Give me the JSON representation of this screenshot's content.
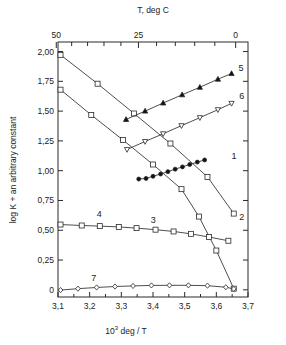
{
  "figure": {
    "top_axis_title": "T, deg C",
    "bottom_axis_title_prefix": "10",
    "bottom_axis_title_sup": "3",
    "bottom_axis_title_suffix": " deg / T",
    "y_axis_title": "log K + an arbitrary constant"
  },
  "chart_data": {
    "type": "line",
    "title": "",
    "xlabel": "10^3 deg / T",
    "ylabel": "log K + an arbitrary constant",
    "xlim": [
      3.1,
      3.7
    ],
    "ylim": [
      -0.06,
      2.08
    ],
    "grid": false,
    "legend": "inline-curve-labels",
    "x_ticks": [
      3.1,
      3.2,
      3.3,
      3.4,
      3.5,
      3.6,
      3.7
    ],
    "x_tick_labels": [
      "3,1",
      "3,2",
      "3,3",
      "3,4",
      "3,5",
      "3,6",
      "3,7"
    ],
    "x_minor_ticks": [
      3.15,
      3.25,
      3.35,
      3.45,
      3.55,
      3.65
    ],
    "y_ticks": [
      0,
      0.25,
      0.5,
      0.75,
      1.0,
      1.25,
      1.5,
      1.75,
      2.0
    ],
    "y_tick_labels": [
      "0",
      "0,25",
      "0,50",
      "0,75",
      "1,00",
      "1,25",
      "1,50",
      "1,75",
      "2,00"
    ],
    "secondary_x_axis": {
      "label": "T, deg C",
      "labeled_ticks": [
        {
          "temp_c": 50,
          "x": 3.095
        },
        {
          "temp_c": 25,
          "x": 3.354
        },
        {
          "temp_c": 0,
          "x": 3.661
        }
      ],
      "minor_temps_c": [
        45,
        40,
        35,
        30,
        20,
        15,
        10,
        5
      ]
    },
    "series": [
      {
        "name": "1",
        "label": "1",
        "marker": "filled-circle",
        "label_x": 3.648,
        "label_y": 1.1,
        "x": [
          3.355,
          3.378,
          3.4,
          3.424,
          3.447,
          3.47,
          3.493,
          3.516,
          3.54,
          3.563
        ],
        "y": [
          0.93,
          0.935,
          0.953,
          0.972,
          0.992,
          1.013,
          1.032,
          1.052,
          1.072,
          1.09
        ]
      },
      {
        "name": "2",
        "label": "2",
        "marker": "open-square",
        "label_x": 3.672,
        "label_y": 0.585,
        "x": [
          3.108,
          3.225,
          3.34,
          3.455,
          3.572,
          3.655
        ],
        "y": [
          1.972,
          1.73,
          1.48,
          1.228,
          0.948,
          0.64
        ]
      },
      {
        "name": "3",
        "label": "3",
        "marker": "open-square",
        "label_x": 3.393,
        "label_y": 0.56,
        "x": [
          3.108,
          3.205,
          3.305,
          3.4,
          3.49,
          3.545,
          3.6,
          3.655
        ],
        "y": [
          1.68,
          1.468,
          1.258,
          1.052,
          0.845,
          0.615,
          0.33,
          0.01
        ]
      },
      {
        "name": "4",
        "label": "4",
        "marker": "open-square",
        "label_x": 3.222,
        "label_y": 0.612,
        "x": [
          3.108,
          3.175,
          3.232,
          3.292,
          3.348,
          3.408,
          3.465,
          3.52,
          3.577,
          3.638
        ],
        "y": [
          0.548,
          0.54,
          0.535,
          0.528,
          0.518,
          0.505,
          0.49,
          0.47,
          0.443,
          0.412
        ]
      },
      {
        "name": "5",
        "label": "5",
        "marker": "filled-triangle-up",
        "label_x": 3.67,
        "label_y": 1.838,
        "x": [
          3.315,
          3.375,
          3.432,
          3.492,
          3.548,
          3.605,
          3.648
        ],
        "y": [
          1.43,
          1.5,
          1.568,
          1.637,
          1.7,
          1.768,
          1.815
        ]
      },
      {
        "name": "6",
        "label": "6",
        "marker": "open-triangle-down",
        "label_x": 3.672,
        "label_y": 1.598,
        "x": [
          3.318,
          3.375,
          3.432,
          3.49,
          3.548,
          3.605,
          3.648
        ],
        "y": [
          1.178,
          1.245,
          1.31,
          1.378,
          1.445,
          1.512,
          1.565
        ]
      },
      {
        "name": "7",
        "label": "7",
        "marker": "open-diamond",
        "label_x": 3.205,
        "label_y": 0.078,
        "x": [
          3.108,
          3.163,
          3.222,
          3.28,
          3.337,
          3.395,
          3.452,
          3.512,
          3.572,
          3.63,
          3.655
        ],
        "y": [
          -0.002,
          0.01,
          0.02,
          0.028,
          0.033,
          0.037,
          0.038,
          0.038,
          0.035,
          0.022,
          0.008
        ]
      }
    ]
  }
}
